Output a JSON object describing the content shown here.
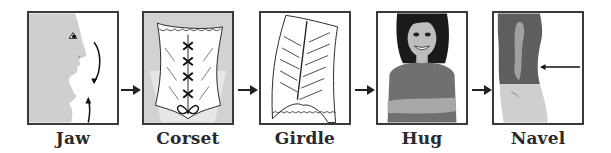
{
  "diagram": {
    "steps": [
      {
        "label": "Jaw",
        "icon": "jaw-profile-icon"
      },
      {
        "label": "Corset",
        "icon": "corset-icon"
      },
      {
        "label": "Girdle",
        "icon": "girdle-icon"
      },
      {
        "label": "Hug",
        "icon": "woman-crossed-arms-icon"
      },
      {
        "label": "Navel",
        "icon": "torso-navel-icon"
      }
    ],
    "connector": "right-arrow-icon"
  },
  "colors": {
    "border": "#3a3a3a",
    "skin_gray": "#c8c8c8",
    "shirt_gray": "#6e6e6e",
    "hair": "#1a1a1a",
    "text": "#2a2a2a"
  }
}
